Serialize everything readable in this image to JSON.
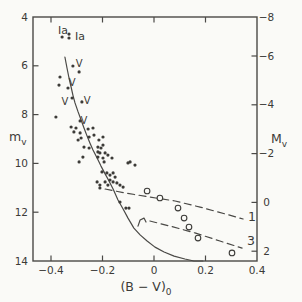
{
  "figure": {
    "background": "#fafaf7",
    "ink": "#3c3b38",
    "line_color": "#4a4946"
  },
  "chart_data": {
    "type": "scatter",
    "title": "",
    "xlabel_main": "(B − V)",
    "xlabel_sub": "0",
    "ylabel_left_main": "m",
    "ylabel_left_sub": "v",
    "ylabel_right_main": "M",
    "ylabel_right_sub": "v",
    "xlim": [
      -0.47,
      0.4
    ],
    "ylim_left_mv": [
      4,
      14
    ],
    "ylim_right_Mv": [
      -7.6,
      2.4
    ],
    "distance_modulus": 11.6,
    "grid": false,
    "legend": "none",
    "x_ticks": [
      -0.4,
      -0.2,
      0,
      0.2,
      0.4
    ],
    "x_tick_labels": [
      "−0.4",
      "−0.2",
      "0",
      "0.2",
      "0.4"
    ],
    "y_left_ticks": [
      4,
      6,
      8,
      10,
      12,
      14
    ],
    "y_left_tick_labels": [
      "4",
      "6",
      "8",
      "10",
      "12",
      "14"
    ],
    "y_right_ticks": [
      -8,
      -6,
      -4,
      -2,
      0,
      2
    ],
    "y_right_tick_labels": [
      "−8",
      "−6",
      "−4",
      "−2",
      "0",
      "2"
    ],
    "series": [
      {
        "name": "cluster_stars_filled",
        "marker": "filled_dot",
        "points": [
          [
            -0.357,
            4.82
          ],
          [
            -0.33,
            4.7
          ],
          [
            -0.33,
            4.86
          ],
          [
            -0.315,
            6.01
          ],
          [
            -0.291,
            6.25
          ],
          [
            -0.365,
            6.46
          ],
          [
            -0.369,
            6.79
          ],
          [
            -0.334,
            6.91
          ],
          [
            -0.318,
            7.32
          ],
          [
            -0.28,
            7.48
          ],
          [
            -0.381,
            8.1
          ],
          [
            -0.287,
            8.26
          ],
          [
            -0.322,
            8.51
          ],
          [
            -0.303,
            8.55
          ],
          [
            -0.311,
            8.71
          ],
          [
            -0.287,
            8.75
          ],
          [
            -0.256,
            8.59
          ],
          [
            -0.237,
            8.55
          ],
          [
            -0.283,
            8.96
          ],
          [
            -0.295,
            9.04
          ],
          [
            -0.252,
            8.92
          ],
          [
            -0.233,
            8.84
          ],
          [
            -0.214,
            9.04
          ],
          [
            -0.272,
            9.33
          ],
          [
            -0.252,
            9.37
          ],
          [
            -0.218,
            9.33
          ],
          [
            -0.206,
            9.37
          ],
          [
            -0.198,
            9.25
          ],
          [
            -0.198,
            8.92
          ],
          [
            -0.276,
            9.74
          ],
          [
            -0.218,
            9.53
          ],
          [
            -0.218,
            9.74
          ],
          [
            -0.198,
            9.78
          ],
          [
            -0.179,
            9.66
          ],
          [
            -0.163,
            9.78
          ],
          [
            -0.291,
            9.94
          ],
          [
            -0.194,
            9.94
          ],
          [
            -0.21,
            9.57
          ],
          [
            -0.19,
            9.57
          ],
          [
            -0.093,
            9.94
          ],
          [
            -0.101,
            9.98
          ],
          [
            -0.074,
            10.07
          ],
          [
            -0.202,
            10.35
          ],
          [
            -0.183,
            10.39
          ],
          [
            -0.171,
            10.48
          ],
          [
            -0.159,
            10.39
          ],
          [
            -0.151,
            10.56
          ],
          [
            -0.171,
            10.68
          ],
          [
            -0.19,
            10.76
          ],
          [
            -0.159,
            10.76
          ],
          [
            -0.144,
            10.8
          ],
          [
            -0.179,
            10.89
          ],
          [
            -0.21,
            10.89
          ],
          [
            -0.221,
            10.76
          ],
          [
            -0.132,
            10.89
          ],
          [
            -0.12,
            10.97
          ],
          [
            -0.21,
            11.01
          ],
          [
            -0.132,
            11.58
          ],
          [
            -0.109,
            11.83
          ],
          [
            -0.097,
            11.83
          ]
        ]
      },
      {
        "name": "field_stars_open",
        "marker": "open_circle",
        "points": [
          [
            -0.027,
            11.13
          ],
          [
            0.023,
            11.42
          ],
          [
            0.093,
            11.83
          ],
          [
            0.117,
            12.24
          ],
          [
            0.136,
            12.61
          ],
          [
            0.171,
            13.06
          ],
          [
            0.303,
            13.67
          ]
        ]
      }
    ],
    "curves": [
      {
        "name": "main_sequence",
        "style": "solid",
        "points": [
          [
            -0.346,
            5.64
          ],
          [
            -0.338,
            6.09
          ],
          [
            -0.33,
            6.5
          ],
          [
            -0.322,
            6.87
          ],
          [
            -0.315,
            7.2
          ],
          [
            -0.307,
            7.52
          ],
          [
            -0.295,
            7.89
          ],
          [
            -0.283,
            8.22
          ],
          [
            -0.272,
            8.55
          ],
          [
            -0.26,
            8.88
          ],
          [
            -0.249,
            9.16
          ],
          [
            -0.237,
            9.45
          ],
          [
            -0.221,
            9.78
          ],
          [
            -0.206,
            10.11
          ],
          [
            -0.19,
            10.43
          ],
          [
            -0.175,
            10.72
          ],
          [
            -0.159,
            11.05
          ],
          [
            -0.14,
            11.5
          ],
          [
            -0.12,
            11.87
          ],
          [
            -0.101,
            12.24
          ],
          [
            -0.078,
            12.65
          ],
          [
            -0.054,
            12.93
          ],
          [
            -0.027,
            13.18
          ],
          [
            0.004,
            13.43
          ],
          [
            0.039,
            13.63
          ],
          [
            0.078,
            13.8
          ],
          [
            0.12,
            13.92
          ],
          [
            0.155,
            14.0
          ],
          [
            0.19,
            14.02
          ]
        ]
      },
      {
        "name": "fiducial_line_1",
        "style": "dashed",
        "label": "1",
        "points": [
          [
            -0.19,
            11.05
          ],
          [
            -0.113,
            11.21
          ],
          [
            -0.016,
            11.38
          ],
          [
            0.082,
            11.54
          ],
          [
            0.179,
            11.79
          ],
          [
            0.276,
            12.07
          ],
          [
            0.346,
            12.28
          ]
        ]
      },
      {
        "name": "fiducial_line_3_jog",
        "style": "solid",
        "label": "",
        "points": [
          [
            -0.062,
            12.57
          ],
          [
            -0.054,
            12.32
          ],
          [
            -0.039,
            12.24
          ],
          [
            -0.031,
            12.4
          ]
        ]
      },
      {
        "name": "fiducial_line_3",
        "style": "dashed",
        "label": "3",
        "points": [
          [
            -0.016,
            12.36
          ],
          [
            0.062,
            12.57
          ],
          [
            0.159,
            12.85
          ],
          [
            0.256,
            13.18
          ],
          [
            0.342,
            13.47
          ]
        ]
      }
    ],
    "annotations": [
      {
        "text": "Ia",
        "x": -0.353,
        "mv": 4.55,
        "size": 11
      },
      {
        "text": "Ia",
        "x": -0.287,
        "mv": 4.78,
        "size": 11
      },
      {
        "text": "V",
        "x": -0.291,
        "mv": 5.89,
        "size": 10
      },
      {
        "text": "V",
        "x": -0.318,
        "mv": 6.7,
        "size": 10
      },
      {
        "text": "V",
        "x": -0.346,
        "mv": 7.48,
        "size": 10
      },
      {
        "text": "V",
        "x": -0.26,
        "mv": 7.44,
        "size": 10
      },
      {
        "text": "V",
        "x": -0.272,
        "mv": 8.26,
        "size": 10
      },
      {
        "text": "1",
        "x": 0.381,
        "mv": 12.2,
        "size": 12.5
      },
      {
        "text": "3",
        "x": 0.377,
        "mv": 13.18,
        "size": 12.5
      }
    ]
  }
}
